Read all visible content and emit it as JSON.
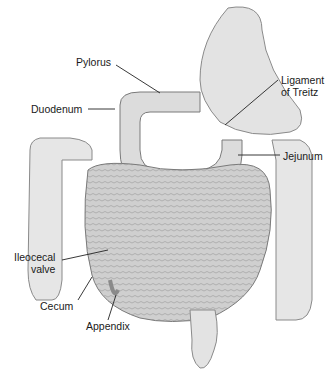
{
  "diagram": {
    "labels": [
      {
        "id": "pylorus",
        "text": "Pylorus"
      },
      {
        "id": "duodenum",
        "text": "Duodenum"
      },
      {
        "id": "ligament",
        "line1": "Ligament",
        "line2": "of Treitz"
      },
      {
        "id": "jejunum",
        "text": "Jejunum"
      },
      {
        "id": "ileocecal",
        "line1": "Ileocecal",
        "line2": "valve"
      },
      {
        "id": "cecum",
        "text": "Cecum"
      },
      {
        "id": "appendix",
        "text": "Appendix"
      }
    ],
    "colors": {
      "tissue": "#d9d9d9",
      "tissue_dark": "#a8a8a8",
      "outline": "#7a7a7a",
      "leader": "#222222"
    }
  }
}
